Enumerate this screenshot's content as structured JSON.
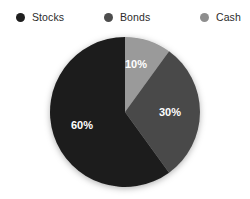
{
  "chart_data": {
    "type": "pie",
    "title": "",
    "categories": [
      "Stocks",
      "Bonds",
      "Cash"
    ],
    "values": [
      60,
      30,
      10
    ],
    "value_labels": [
      "60%",
      "30%",
      "10%"
    ],
    "unit": "%",
    "total": 100,
    "start_angle_deg": 0,
    "direction": "clockwise",
    "legend_position": "top",
    "grid": false,
    "colors": [
      "#1c1c1c",
      "#4a4a4a",
      "#9a9a9a"
    ],
    "background": "#ffffff",
    "label_color": "#ffffff",
    "slices": [
      {
        "name": "Stocks",
        "value": 60,
        "label": "60%",
        "color": "#1c1c1c"
      },
      {
        "name": "Bonds",
        "value": 30,
        "label": "30%",
        "color": "#4a4a4a"
      },
      {
        "name": "Cash",
        "value": 10,
        "label": "10%",
        "color": "#9a9a9a"
      }
    ]
  },
  "legend": {
    "items": [
      {
        "label": "Stocks",
        "color": "#1f1f1f",
        "marker": "circle-marker"
      },
      {
        "label": "Bonds",
        "color": "#4d4d4d",
        "marker": "circle-marker"
      },
      {
        "label": "Cash",
        "color": "#8e8e8e",
        "marker": "circle-marker"
      }
    ]
  },
  "pie": {
    "center_x": 125,
    "center_y": 112,
    "radius": 75,
    "labels": [
      {
        "text": "10%",
        "x": 136,
        "y": 65
      },
      {
        "text": "30%",
        "x": 170,
        "y": 113
      },
      {
        "text": "60%",
        "x": 82,
        "y": 126
      }
    ]
  }
}
